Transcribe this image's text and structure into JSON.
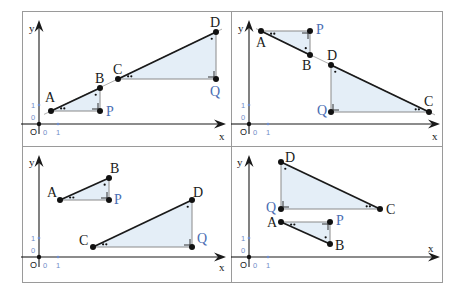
{
  "figure": {
    "width": 465,
    "height": 294,
    "frame": {
      "left": 22,
      "top": 11,
      "right": 443,
      "bottom": 283
    },
    "divider_x": 231,
    "divider_y": 146,
    "colors": {
      "frame": "#9a9a9a",
      "axis": "#1a1a1a",
      "segment": "#1a1a1a",
      "leg": "#8a8a8a",
      "fill": "#e4eef7",
      "point": "#111111",
      "blue_label": "#4a6db3",
      "tick": "#6f8cc8"
    },
    "axis_labels": {
      "x": "x",
      "y": "y",
      "origin": "O",
      "zero": "0",
      "one": "1"
    }
  },
  "panels": [
    {
      "id": "top-left",
      "origin": [
        39,
        124
      ],
      "x_axis_end": 226,
      "y_axis_top": 20,
      "unit_px": 19,
      "x_label_pos": [
        219,
        140
      ],
      "y_label_pos": [
        29,
        32
      ],
      "triangles": [
        {
          "points": {
            "A": [
              51,
              111
            ],
            "B": [
              100,
              88
            ],
            "P": [
              100,
              111
            ]
          },
          "hyp": [
            "A",
            "B"
          ],
          "right": "P",
          "acute2": "A",
          "acute1": "B",
          "labels": {
            "A": [
              45,
              102,
              "A",
              false
            ],
            "B": [
              95,
              83,
              "B",
              false
            ],
            "P": [
              106,
              116,
              "P",
              true
            ]
          }
        },
        {
          "points": {
            "C": [
              118,
              79
            ],
            "D": [
              216,
              32
            ],
            "Q": [
              216,
              79
            ]
          },
          "hyp": [
            "C",
            "D"
          ],
          "right": "Q",
          "acute2": "C",
          "acute1": "D",
          "labels": {
            "C": [
              113,
              74,
              "C",
              false
            ],
            "D": [
              210,
              27,
              "D",
              false
            ],
            "Q": [
              210,
              96,
              "Q",
              true
            ]
          }
        }
      ],
      "extension": [
        [
          44,
          114.4
        ],
        [
          222,
          29.1
        ]
      ]
    },
    {
      "id": "top-right",
      "origin": [
        249,
        124
      ],
      "x_axis_end": 440,
      "y_axis_top": 20,
      "unit_px": 19,
      "x_label_pos": [
        432,
        140
      ],
      "y_label_pos": [
        238,
        32
      ],
      "triangles": [
        {
          "points": {
            "A": [
              261,
              31
            ],
            "B": [
              310,
              55
            ],
            "P": [
              310,
              31
            ]
          },
          "hyp": [
            "A",
            "B"
          ],
          "right": "P",
          "acute2": "A",
          "acute1": "B",
          "labels": {
            "A": [
              256,
              47,
              "A",
              false
            ],
            "B": [
              302,
              70,
              "B",
              false
            ],
            "P": [
              316,
              34,
              "P",
              true
            ]
          }
        },
        {
          "points": {
            "D": [
              331,
              65
            ],
            "C": [
              429,
              112
            ],
            "Q": [
              331,
              112
            ]
          },
          "hyp": [
            "D",
            "C"
          ],
          "right": "Q",
          "acute2": "C",
          "acute1": "D",
          "labels": {
            "D": [
              327,
              60,
              "D",
              false
            ],
            "C": [
              424,
              106,
              "C",
              false
            ],
            "Q": [
              317,
              115,
              "Q",
              true
            ]
          }
        }
      ],
      "extension": [
        [
          256,
          28.6
        ],
        [
          435,
          114.9
        ]
      ]
    },
    {
      "id": "bottom-left",
      "origin": [
        39,
        257
      ],
      "x_axis_end": 226,
      "y_axis_top": 155,
      "unit_px": 19,
      "x_label_pos": [
        219,
        271
      ],
      "y_label_pos": [
        29,
        166
      ],
      "triangles": [
        {
          "points": {
            "A": [
              60,
              200
            ],
            "B": [
              109,
              178
            ],
            "P": [
              109,
              200
            ]
          },
          "hyp": [
            "A",
            "B"
          ],
          "right": "P",
          "acute2": "A",
          "acute1": "B",
          "labels": {
            "A": [
              47,
              197,
              "A",
              false
            ],
            "B": [
              110,
              173,
              "B",
              false
            ],
            "P": [
              114,
              204,
              "P",
              true
            ]
          }
        },
        {
          "points": {
            "C": [
              93,
              247
            ],
            "D": [
              192,
              200
            ],
            "Q": [
              192,
              247
            ]
          },
          "hyp": [
            "C",
            "D"
          ],
          "right": "Q",
          "acute2": "C",
          "acute1": "D",
          "labels": {
            "C": [
              79,
              245,
              "C",
              false
            ],
            "D": [
              193,
              197,
              "D",
              false
            ],
            "Q": [
              197,
              243,
              "Q",
              true
            ]
          }
        }
      ],
      "extension": null
    },
    {
      "id": "bottom-right",
      "origin": [
        249,
        257
      ],
      "x_axis_end": 440,
      "y_axis_top": 155,
      "unit_px": 19,
      "x_label_pos": [
        428,
        252
      ],
      "y_label_pos": [
        237,
        166
      ],
      "triangles": [
        {
          "points": {
            "D": [
              281,
              162
            ],
            "C": [
              380,
              209
            ],
            "Q": [
              281,
              209
            ]
          },
          "hyp": [
            "D",
            "C"
          ],
          "right": "Q",
          "acute2": "C",
          "acute1": "D",
          "labels": {
            "D": [
              285,
              162,
              "D",
              false
            ],
            "C": [
              386,
              214,
              "C",
              false
            ],
            "Q": [
              266,
              212,
              "Q",
              true
            ]
          }
        },
        {
          "points": {
            "A": [
              281,
              222
            ],
            "B": [
              330,
              244
            ],
            "P": [
              330,
              222
            ]
          },
          "hyp": [
            "A",
            "B"
          ],
          "right": "P",
          "acute2": "A",
          "acute1": "B",
          "labels": {
            "A": [
              267,
              227,
              "A",
              false
            ],
            "B": [
              335,
              250,
              "B",
              false
            ],
            "P": [
              336,
              225,
              "P",
              true
            ]
          }
        }
      ],
      "extension": null
    }
  ]
}
